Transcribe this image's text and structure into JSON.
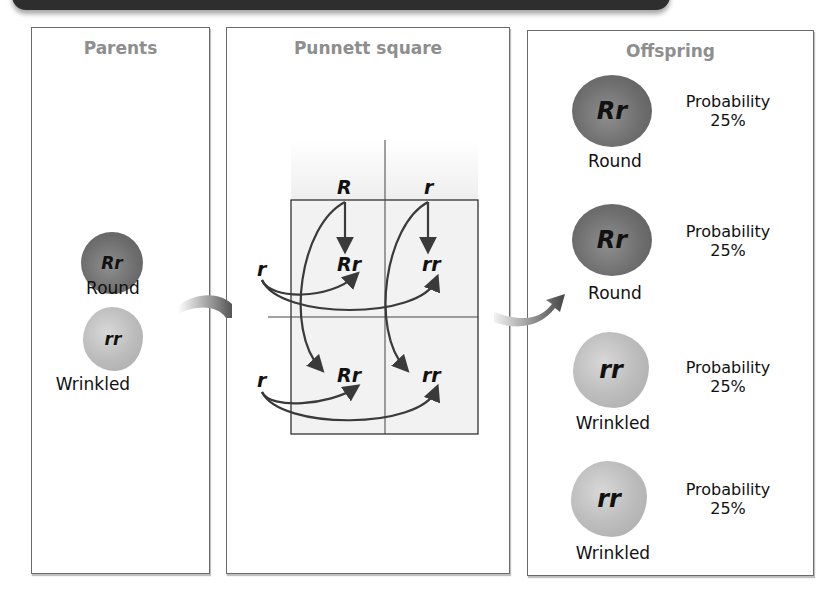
{
  "panels": {
    "parents": {
      "title": "Parents",
      "peas": [
        {
          "genotype": "Rr",
          "phenotype": "Round",
          "type": "round"
        },
        {
          "genotype": "rr",
          "phenotype": "Wrinkled",
          "type": "wrinkled"
        }
      ]
    },
    "punnett": {
      "title": "Punnett square",
      "column_alleles": [
        "R",
        "r"
      ],
      "row_alleles": [
        "r",
        "r"
      ],
      "cells": [
        [
          "Rr",
          "rr"
        ],
        [
          "Rr",
          "rr"
        ]
      ]
    },
    "offspring": {
      "title": "Offspring",
      "items": [
        {
          "genotype": "Rr",
          "phenotype": "Round",
          "probability_label": "Probability",
          "probability": "25%",
          "type": "round"
        },
        {
          "genotype": "Rr",
          "phenotype": "Round",
          "probability_label": "Probability",
          "probability": "25%",
          "type": "round"
        },
        {
          "genotype": "rr",
          "phenotype": "Wrinkled",
          "probability_label": "Probability",
          "probability": "25%",
          "type": "wrinkled"
        },
        {
          "genotype": "rr",
          "phenotype": "Wrinkled",
          "probability_label": "Probability",
          "probability": "25%",
          "type": "wrinkled"
        }
      ]
    }
  },
  "colors": {
    "panel_title": "#8e8e8e",
    "round_pea": "#6e6e6e",
    "wrinkled_pea": "#bdbdbd",
    "banner": "#2e2e2e"
  }
}
